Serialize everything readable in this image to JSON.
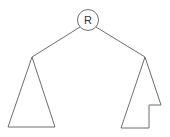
{
  "diagram": {
    "type": "tree",
    "root": {
      "label": "R",
      "cx": 88,
      "cy": 20,
      "r": 10.5
    },
    "edges": [
      {
        "name": "edge-root-left",
        "x1": 80,
        "y1": 27,
        "x2": 32,
        "y2": 57
      },
      {
        "name": "edge-root-right",
        "x1": 96,
        "y1": 27,
        "x2": 145,
        "y2": 57
      }
    ],
    "subtrees": [
      {
        "name": "left-subtree",
        "shape": "triangle",
        "points": "32,57 8,127 55,127"
      },
      {
        "name": "right-subtree",
        "shape": "notched-triangle",
        "points": "145,57 161,105 149,105 149,128 121,128"
      }
    ],
    "colors": {
      "stroke": "#6e6e6e",
      "background": "#ffffff",
      "label": "#333333"
    }
  }
}
